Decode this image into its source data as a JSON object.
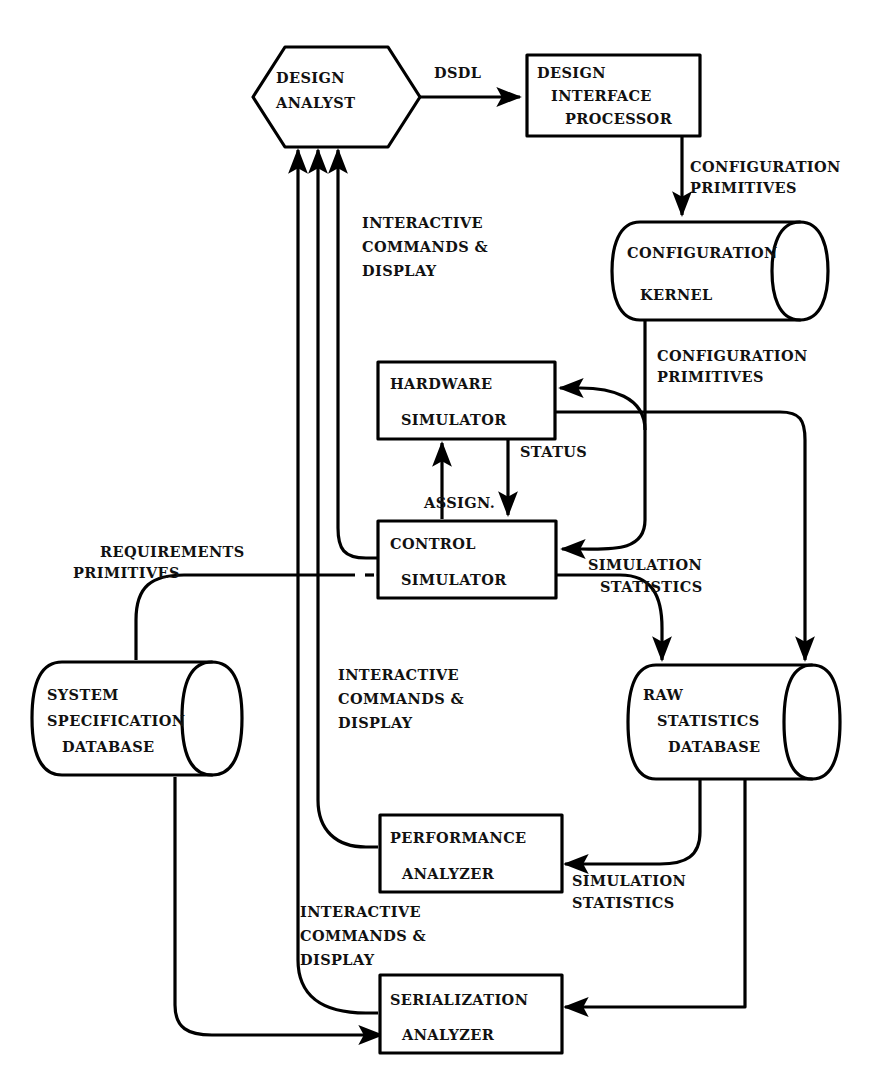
{
  "diagram": {
    "type": "dataflow-block-diagram",
    "background_color": "#ffffff",
    "line_color": "#000000",
    "text_color": "#111111"
  },
  "nodes": {
    "design_analyst": {
      "id": "design-analyst",
      "shape": "hexagon",
      "lines": [
        "DESIGN",
        "ANALYST"
      ]
    },
    "design_interface_processor": {
      "id": "design-interface-processor",
      "shape": "rectangle",
      "lines": [
        "DESIGN",
        "INTERFACE",
        "PROCESSOR"
      ]
    },
    "configuration_kernel": {
      "id": "configuration-kernel",
      "shape": "cylinder",
      "lines": [
        "CONFIGURATION",
        "KERNEL"
      ]
    },
    "hardware_simulator": {
      "id": "hardware-simulator",
      "shape": "rectangle",
      "lines": [
        "HARDWARE",
        "SIMULATOR"
      ]
    },
    "control_simulator": {
      "id": "control-simulator",
      "shape": "rectangle",
      "lines": [
        "CONTROL",
        "SIMULATOR"
      ]
    },
    "system_specification_database": {
      "id": "system-specification-database",
      "shape": "cylinder",
      "lines": [
        "SYSTEM",
        "SPECIFICATION",
        "DATABASE"
      ]
    },
    "raw_statistics_database": {
      "id": "raw-statistics-database",
      "shape": "cylinder",
      "lines": [
        "RAW",
        "STATISTICS",
        "DATABASE"
      ]
    },
    "performance_analyzer": {
      "id": "performance-analyzer",
      "shape": "rectangle",
      "lines": [
        "PERFORMANCE",
        "ANALYZER"
      ]
    },
    "serialization_analyzer": {
      "id": "serialization-analyzer",
      "shape": "rectangle",
      "lines": [
        "SERIALIZATION",
        "ANALYZER"
      ]
    }
  },
  "edge_labels": {
    "dsdl": {
      "lines": [
        "DSDL"
      ]
    },
    "config_primitives_top": {
      "lines": [
        "CONFIGURATION",
        "PRIMITIVES"
      ]
    },
    "config_primitives_mid": {
      "lines": [
        "CONFIGURATION",
        "PRIMITIVES"
      ]
    },
    "interactive_top": {
      "lines": [
        "INTERACTIVE",
        "COMMANDS &",
        "DISPLAY"
      ]
    },
    "interactive_mid": {
      "lines": [
        "INTERACTIVE",
        "COMMANDS &",
        "DISPLAY"
      ]
    },
    "interactive_bottom": {
      "lines": [
        "INTERACTIVE",
        "COMMANDS &",
        "DISPLAY"
      ]
    },
    "status": {
      "lines": [
        "STATUS"
      ]
    },
    "assign": {
      "lines": [
        "ASSIGN."
      ]
    },
    "requirements_primitives": {
      "lines": [
        "REQUIREMENTS",
        "PRIMITIVES"
      ]
    },
    "simulation_statistics_mid": {
      "lines": [
        "SIMULATION",
        "STATISTICS"
      ]
    },
    "simulation_statistics_bottom": {
      "lines": [
        "SIMULATION",
        "STATISTICS"
      ]
    }
  },
  "flows": [
    {
      "from": "design-analyst",
      "to": "design-interface-processor",
      "label": "DSDL"
    },
    {
      "from": "design-interface-processor",
      "to": "configuration-kernel",
      "label": "CONFIGURATION PRIMITIVES"
    },
    {
      "from": "configuration-kernel",
      "to": "hardware-simulator",
      "label": "CONFIGURATION PRIMITIVES"
    },
    {
      "from": "configuration-kernel",
      "to": "control-simulator",
      "label": "CONFIGURATION PRIMITIVES"
    },
    {
      "from": "hardware-simulator",
      "to": "control-simulator",
      "label": "STATUS"
    },
    {
      "from": "control-simulator",
      "to": "hardware-simulator",
      "label": "ASSIGN."
    },
    {
      "from": "system-specification-database",
      "to": "control-simulator",
      "label": "REQUIREMENTS PRIMITIVES"
    },
    {
      "from": "control-simulator",
      "to": "raw-statistics-database",
      "label": "SIMULATION STATISTICS"
    },
    {
      "from": "hardware-simulator",
      "to": "raw-statistics-database",
      "label": "SIMULATION STATISTICS"
    },
    {
      "from": "raw-statistics-database",
      "to": "performance-analyzer",
      "label": "SIMULATION STATISTICS"
    },
    {
      "from": "raw-statistics-database",
      "to": "serialization-analyzer",
      "label": "SIMULATION STATISTICS"
    },
    {
      "from": "system-specification-database",
      "to": "serialization-analyzer",
      "label": ""
    },
    {
      "from": "control-simulator",
      "to": "design-analyst",
      "label": "INTERACTIVE COMMANDS & DISPLAY"
    },
    {
      "from": "performance-analyzer",
      "to": "design-analyst",
      "label": "INTERACTIVE COMMANDS & DISPLAY"
    },
    {
      "from": "serialization-analyzer",
      "to": "design-analyst",
      "label": "INTERACTIVE COMMANDS & DISPLAY"
    }
  ]
}
